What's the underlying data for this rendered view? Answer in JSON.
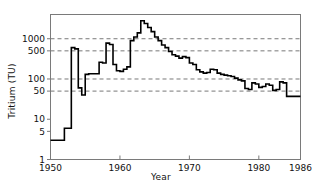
{
  "chart_data": {
    "type": "line",
    "subtype": "step-post",
    "title": "",
    "xlabel": "Year",
    "ylabel": "Tritium (TU)",
    "xlim": [
      1950,
      1986
    ],
    "ylim": [
      1,
      4000
    ],
    "yscale": "log",
    "xscale": "linear",
    "grid": true,
    "grid_style": "dashed-horizontal",
    "grid_values": [
      50,
      100,
      500,
      1000
    ],
    "xticks": [
      1950,
      1960,
      1970,
      1980,
      1986
    ],
    "xticklabels": [
      "1950",
      "1960",
      "1970",
      "1980",
      "1986"
    ],
    "yticks": [
      1,
      5,
      10,
      50,
      100,
      500,
      1000
    ],
    "yticklabels": [
      "1",
      "5",
      "10",
      "50",
      "100",
      "500",
      "1000"
    ],
    "legend": null,
    "series": [
      {
        "name": "Tritium in precipitation",
        "color": "#000000",
        "x": [
          1950,
          1951,
          1952,
          1953,
          1954,
          1955,
          1956,
          1957,
          1958,
          1959,
          1960,
          1961,
          1962,
          1963,
          1964,
          1965,
          1966,
          1967,
          1968,
          1969,
          1970,
          1971,
          1972,
          1973,
          1974,
          1975,
          1976,
          1977,
          1978,
          1979,
          1980,
          1981,
          1982,
          1983,
          1984,
          1985,
          1986
        ],
        "values": [
          3,
          3,
          6,
          600,
          45,
          130,
          135,
          260,
          780,
          160,
          155,
          200,
          1100,
          2800,
          1500,
          900,
          600,
          400,
          330,
          340,
          230,
          150,
          145,
          170,
          130,
          120,
          105,
          90,
          55,
          75,
          65,
          70,
          55,
          80,
          37,
          37,
          37
        ],
        "x_fine": [
          1950.0,
          1951.0,
          1951.5,
          1952.0,
          1952.5,
          1953.0,
          1953.5,
          1954.0,
          1954.5,
          1955.0,
          1955.5,
          1956.0,
          1956.5,
          1957.0,
          1957.5,
          1958.0,
          1958.5,
          1959.0,
          1959.5,
          1960.0,
          1960.5,
          1961.0,
          1961.5,
          1962.0,
          1962.5,
          1963.0,
          1963.5,
          1964.0,
          1964.5,
          1965.0,
          1965.5,
          1966.0,
          1966.5,
          1967.0,
          1967.5,
          1968.0,
          1968.5,
          1969.0,
          1969.5,
          1970.0,
          1970.5,
          1971.0,
          1971.5,
          1972.0,
          1972.5,
          1973.0,
          1973.5,
          1974.0,
          1974.5,
          1975.0,
          1975.5,
          1976.0,
          1976.5,
          1977.0,
          1977.5,
          1978.0,
          1978.5,
          1979.0,
          1979.5,
          1980.0,
          1980.5,
          1981.0,
          1981.5,
          1982.0,
          1982.5,
          1983.0,
          1983.5,
          1984.0,
          1984.5,
          1985.0,
          1985.5,
          1986.0
        ],
        "values_fine": [
          3,
          3,
          3,
          6,
          6,
          600,
          560,
          60,
          40,
          130,
          135,
          135,
          135,
          260,
          250,
          780,
          720,
          230,
          160,
          155,
          175,
          200,
          900,
          1100,
          1400,
          2800,
          2400,
          1900,
          1500,
          1100,
          900,
          700,
          600,
          480,
          400,
          370,
          330,
          360,
          340,
          250,
          230,
          170,
          150,
          140,
          145,
          175,
          170,
          140,
          130,
          125,
          120,
          115,
          105,
          95,
          90,
          58,
          55,
          80,
          75,
          62,
          65,
          75,
          70,
          52,
          55,
          85,
          80,
          37,
          37,
          37,
          37,
          37
        ]
      }
    ],
    "annotations": [
      {
        "text": "bomb peak",
        "x": 1963,
        "y": 2800,
        "visible": false
      }
    ]
  },
  "axes": {
    "y_axis_label": "Tritium (TU)",
    "x_axis_label": "Year",
    "y_tick_labels": [
      "1000",
      "500",
      "100",
      "50",
      "10",
      "5",
      "1"
    ],
    "x_tick_labels": [
      "1950",
      "1960",
      "1970",
      "1980",
      "1986"
    ]
  },
  "style": {
    "line_color": "#000000",
    "frame_color": "#7a7a7a",
    "grid_color": "#555555",
    "background": "#ffffff",
    "text_color": "#111111"
  }
}
